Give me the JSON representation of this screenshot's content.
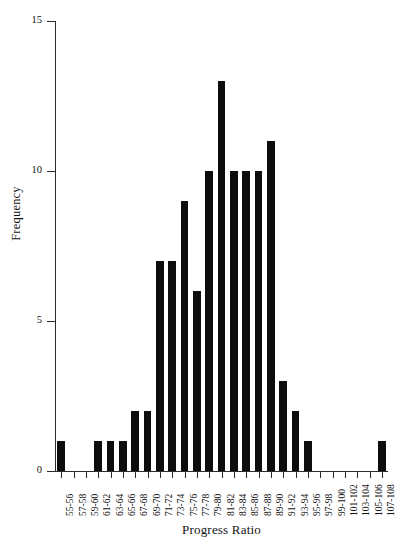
{
  "chart_data": {
    "type": "bar",
    "title": "",
    "subtitle": "",
    "xlabel": "Progress Ratio",
    "ylabel": "Frequency",
    "categories": [
      "55-56",
      "57-58",
      "59-60",
      "61-62",
      "63-64",
      "65-66",
      "67-68",
      "69-70",
      "71-72",
      "73-74",
      "75-76",
      "77-78",
      "79-80",
      "81-82",
      "83-84",
      "85-86",
      "87-88",
      "89-90",
      "91-92",
      "93-94",
      "95-96",
      "97-98",
      "99-100",
      "101-102",
      "103-104",
      "105-106",
      "107-108"
    ],
    "values": [
      1,
      0,
      0,
      1,
      1,
      1,
      2,
      2,
      7,
      7,
      9,
      6,
      10,
      13,
      10,
      10,
      10,
      11,
      3,
      2,
      1,
      0,
      0,
      0,
      0,
      0,
      1
    ],
    "xlim": [
      0,
      27
    ],
    "ylim": [
      0,
      15
    ],
    "yticks": [
      0,
      5,
      10,
      15
    ],
    "ytick_labels": [
      "0",
      "5",
      "10",
      "15"
    ],
    "grid": false,
    "legend": false,
    "bar_color": "#0d0d0d",
    "axis_color": "#2b2b2b",
    "background": "#ffffff"
  },
  "axes": {
    "y_title": "Frequency",
    "x_title": "Progress Ratio"
  }
}
